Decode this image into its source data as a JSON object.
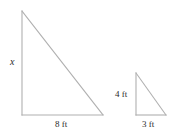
{
  "figure": {
    "background_color": "#ffffff",
    "stroke_color": "#b0b0b0",
    "text_color": "#2b2b2b",
    "large_triangle": {
      "name": "large-right-triangle",
      "vertices": {
        "apex": [
          22,
          11
        ],
        "bottom_left": [
          22,
          115
        ],
        "bottom_right": [
          103,
          115
        ]
      },
      "height_label": "x",
      "base_label": "8 ft"
    },
    "small_triangle": {
      "name": "small-right-triangle",
      "vertices": {
        "apex": [
          136,
          73
        ],
        "bottom_left": [
          136,
          115
        ],
        "bottom_right": [
          166,
          115
        ]
      },
      "height_label": "4 ft",
      "base_label": "3 ft"
    }
  }
}
